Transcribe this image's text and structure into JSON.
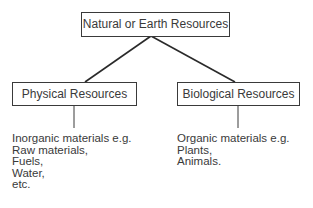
{
  "diagram": {
    "root": {
      "label": "Natural or Earth Resources"
    },
    "children": [
      {
        "label": "Physical Resources",
        "items": [
          "Inorganic materials e.g.",
          "Raw materials,",
          "Fuels,",
          "Water,",
          "etc."
        ]
      },
      {
        "label": "Biological Resources",
        "items": [
          "Organic materials e.g.",
          "Plants,",
          "Animals."
        ]
      }
    ],
    "colors": {
      "line": "#3a3a3a",
      "text": "#3a3a3a",
      "background": "#ffffff"
    }
  }
}
